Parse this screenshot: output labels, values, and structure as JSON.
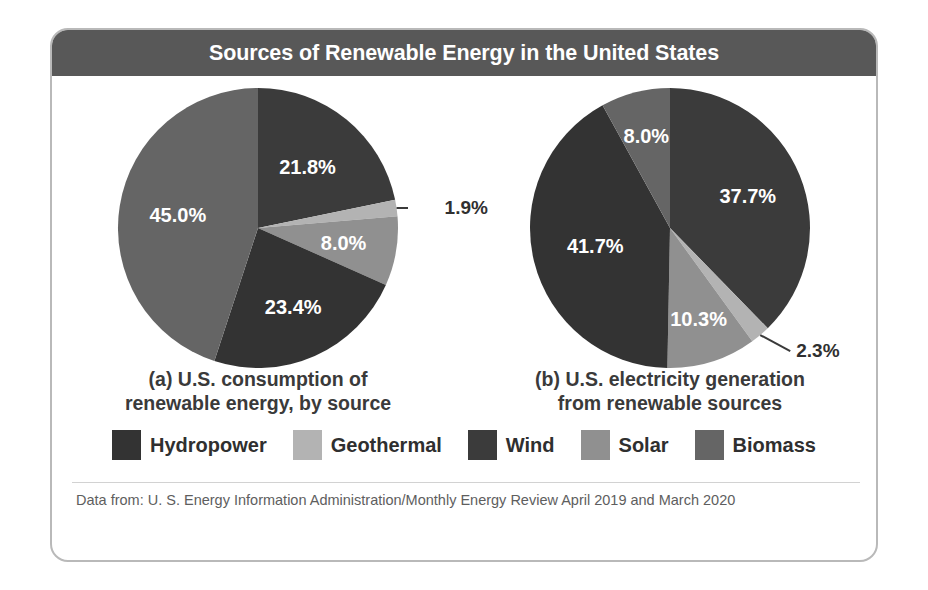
{
  "header": {
    "title": "Sources of Renewable Energy in the United States"
  },
  "footer": {
    "source": "Data from: U. S. Energy Information Administration/Monthly Energy Review April 2019 and March 2020"
  },
  "legend": {
    "items": [
      {
        "label": "Hydropower",
        "color": "#333333"
      },
      {
        "label": "Geothermal",
        "color": "#b3b3b3"
      },
      {
        "label": "Wind",
        "color": "#3b3b3b"
      },
      {
        "label": "Solar",
        "color": "#909090"
      },
      {
        "label": "Biomass",
        "color": "#656565"
      }
    ]
  },
  "charts": [
    {
      "caption_line1": "(a) U.S. consumption of",
      "caption_line2": "renewable energy, by source",
      "labels": {
        "wind": "21.8%",
        "geothermal": "1.9%",
        "solar": "8.0%",
        "hydropower": "23.4%",
        "biomass": "45.0%"
      }
    },
    {
      "caption_line1": "(b) U.S. electricity generation",
      "caption_line2": "from renewable sources",
      "labels": {
        "wind": "37.7%",
        "geothermal": "2.3%",
        "solar": "10.3%",
        "hydropower": "41.7%",
        "biomass": "8.0%"
      }
    }
  ],
  "chart_data": [
    {
      "type": "pie",
      "title": "(a) U.S. consumption of renewable energy, by source",
      "categories": [
        "Wind",
        "Geothermal",
        "Solar",
        "Hydropower",
        "Biomass"
      ],
      "values": [
        21.8,
        1.9,
        8.0,
        23.4,
        45.0
      ],
      "value_labels": [
        "21.8%",
        "1.9%",
        "8.0%",
        "23.4%",
        "45.0%"
      ],
      "colors": [
        "#3b3b3b",
        "#b3b3b3",
        "#909090",
        "#333333",
        "#656565"
      ],
      "units": "percent",
      "start_angle_deg": 0,
      "direction": "clockwise",
      "legend_position": "bottom",
      "grid": false
    },
    {
      "type": "pie",
      "title": "(b) U.S. electricity generation from renewable sources",
      "categories": [
        "Wind",
        "Geothermal",
        "Solar",
        "Hydropower",
        "Biomass"
      ],
      "values": [
        37.7,
        2.3,
        10.3,
        41.7,
        8.0
      ],
      "value_labels": [
        "37.7%",
        "2.3%",
        "10.3%",
        "41.7%",
        "8.0%"
      ],
      "colors": [
        "#3b3b3b",
        "#b3b3b3",
        "#909090",
        "#333333",
        "#656565"
      ],
      "units": "percent",
      "start_angle_deg": 0,
      "direction": "clockwise",
      "legend_position": "bottom",
      "grid": false
    }
  ]
}
